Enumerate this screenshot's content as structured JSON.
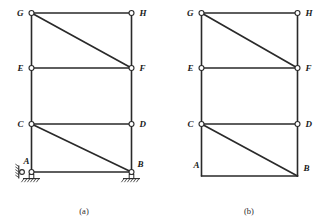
{
  "figure": {
    "kind": "structural-engineering-line-diagram",
    "stroke_color": "#2a2a2a",
    "background_color": "#ffffff",
    "joint_fill_color": "#ffffff"
  },
  "panels": [
    {
      "id": "a",
      "caption": "(a)",
      "has_supports": true,
      "nodes": [
        {
          "id": "G",
          "label": "G",
          "x": 31.5,
          "y": 13.0,
          "marker": "pin-circle",
          "label_side": "left"
        },
        {
          "id": "H",
          "label": "H",
          "x": 131.5,
          "y": 13.0,
          "marker": "pin-circle",
          "label_side": "right"
        },
        {
          "id": "E",
          "label": "E",
          "x": 31.5,
          "y": 68.0,
          "marker": "pin-circle",
          "label_side": "left"
        },
        {
          "id": "F",
          "label": "F",
          "x": 131.5,
          "y": 68.0,
          "marker": "pin-circle",
          "label_side": "right"
        },
        {
          "id": "C",
          "label": "C",
          "x": 31.5,
          "y": 124.0,
          "marker": "pin-circle",
          "label_side": "left"
        },
        {
          "id": "D",
          "label": "D",
          "x": 131.5,
          "y": 124.0,
          "marker": "pin-circle",
          "label_side": "right"
        },
        {
          "id": "A",
          "label": "A",
          "x": 31.5,
          "y": 172.0,
          "marker": "pin-circle",
          "label_side": "upper-left"
        },
        {
          "id": "B",
          "label": "B",
          "x": 131.5,
          "y": 172.0,
          "marker": "pin-circle",
          "label_side": "upper-right"
        }
      ],
      "members": [
        {
          "from": "G",
          "to": "H",
          "type": "beam"
        },
        {
          "from": "E",
          "to": "F",
          "type": "beam"
        },
        {
          "from": "C",
          "to": "D",
          "type": "beam"
        },
        {
          "from": "A",
          "to": "B",
          "type": "beam"
        },
        {
          "from": "G",
          "to": "E",
          "type": "column"
        },
        {
          "from": "E",
          "to": "C",
          "type": "column"
        },
        {
          "from": "C",
          "to": "A",
          "type": "column"
        },
        {
          "from": "H",
          "to": "F",
          "type": "column"
        },
        {
          "from": "F",
          "to": "D",
          "type": "column"
        },
        {
          "from": "D",
          "to": "B",
          "type": "column"
        },
        {
          "from": "G",
          "to": "F",
          "type": "diagonal-brace"
        },
        {
          "from": "C",
          "to": "B",
          "type": "diagonal-brace"
        }
      ],
      "supports": [
        {
          "id": "A-side-roller",
          "type": "roller-vertical-wall",
          "at": "A",
          "x": 22.0,
          "y": 168.0
        },
        {
          "id": "A-ground-pin",
          "type": "pinned-hatched-ground",
          "at": "A",
          "x": 31.5,
          "y": 178.0
        },
        {
          "id": "B-ground-pin",
          "type": "pinned-hatched-ground",
          "at": "B",
          "x": 131.5,
          "y": 178.0
        }
      ]
    },
    {
      "id": "b",
      "caption": "(b)",
      "has_supports": false,
      "nodes": [
        {
          "id": "G",
          "label": "G",
          "x": 201.5,
          "y": 13.0,
          "marker": "pin-circle",
          "label_side": "left"
        },
        {
          "id": "H",
          "label": "H",
          "x": 297.5,
          "y": 13.0,
          "marker": "pin-circle",
          "label_side": "right"
        },
        {
          "id": "E",
          "label": "E",
          "x": 201.5,
          "y": 68.0,
          "marker": "pin-circle",
          "label_side": "left"
        },
        {
          "id": "F",
          "label": "F",
          "x": 297.5,
          "y": 68.0,
          "marker": "pin-circle",
          "label_side": "right"
        },
        {
          "id": "C",
          "label": "C",
          "x": 201.5,
          "y": 124.0,
          "marker": "pin-circle",
          "label_side": "left"
        },
        {
          "id": "D",
          "label": "D",
          "x": 297.5,
          "y": 124.0,
          "marker": "pin-circle",
          "label_side": "right"
        },
        {
          "id": "A",
          "label": "A",
          "x": 201.5,
          "y": 176.0,
          "marker": "rigid-corner",
          "label_side": "upper-left"
        },
        {
          "id": "B",
          "label": "B",
          "x": 297.5,
          "y": 176.0,
          "marker": "rigid-corner",
          "label_side": "upper-right"
        }
      ],
      "members": [
        {
          "from": "G",
          "to": "H",
          "type": "beam"
        },
        {
          "from": "E",
          "to": "F",
          "type": "beam"
        },
        {
          "from": "C",
          "to": "D",
          "type": "beam"
        },
        {
          "from": "A",
          "to": "B",
          "type": "beam"
        },
        {
          "from": "G",
          "to": "E",
          "type": "column"
        },
        {
          "from": "E",
          "to": "C",
          "type": "column"
        },
        {
          "from": "C",
          "to": "A",
          "type": "column"
        },
        {
          "from": "H",
          "to": "F",
          "type": "column"
        },
        {
          "from": "F",
          "to": "D",
          "type": "column"
        },
        {
          "from": "D",
          "to": "B",
          "type": "column"
        },
        {
          "from": "G",
          "to": "F",
          "type": "diagonal-brace"
        },
        {
          "from": "C",
          "to": "B",
          "type": "diagonal-brace"
        }
      ],
      "supports": []
    }
  ],
  "captions": {
    "panel_a": "(a)",
    "panel_b": "(b)",
    "panel_a_x": 84,
    "panel_a_y": 214,
    "panel_b_x": 249,
    "panel_b_y": 214
  }
}
